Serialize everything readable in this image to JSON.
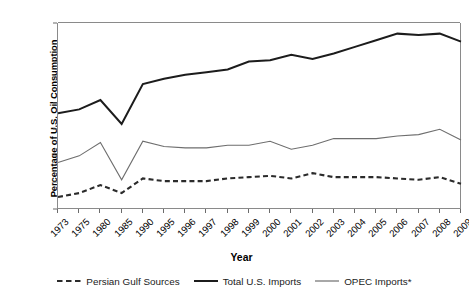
{
  "chart_data": {
    "type": "line",
    "title": "",
    "xlabel": "Year",
    "ylabel": "Percentage of U.S. Oil Consumption",
    "categories": [
      "1973",
      "1975",
      "1980",
      "1985",
      "1990",
      "1995",
      "1996",
      "1997",
      "1998",
      "1999",
      "2000",
      "2001",
      "2002",
      "2003",
      "2004",
      "2005",
      "2006",
      "2007",
      "2008",
      "2009"
    ],
    "ylim": [
      0,
      70
    ],
    "yticks": [
      0,
      10,
      20,
      30,
      40,
      50,
      60,
      70
    ],
    "ytick_labels": [
      "0",
      "10",
      "20",
      "30",
      "40",
      "50",
      "60",
      "70"
    ],
    "grid": false,
    "legend_position": "bottom",
    "series": [
      {
        "name": "Persian Gulf Sources",
        "style": "dashed",
        "color": "#2b2b2b",
        "width": 2.1,
        "values": [
          4.5,
          6.0,
          9.0,
          6.0,
          11.5,
          10.5,
          10.5,
          10.5,
          11.5,
          12.0,
          12.5,
          11.5,
          13.5,
          12.0,
          12.0,
          12.0,
          11.5,
          11.0,
          12.0,
          9.5
        ]
      },
      {
        "name": "Total U.S. Imports",
        "style": "solid",
        "color": "#1c1c1c",
        "width": 2.0,
        "values": [
          36.0,
          37.5,
          41.0,
          32.0,
          47.0,
          49.0,
          50.5,
          51.5,
          52.5,
          55.5,
          56.0,
          58.0,
          56.5,
          58.5,
          61.0,
          63.5,
          66.0,
          65.5,
          66.0,
          63.0
        ]
      },
      {
        "name": "OPEC Imports*",
        "style": "solid",
        "color": "#6e6e6e",
        "width": 1.1,
        "values": [
          17.5,
          20.0,
          25.0,
          11.0,
          25.5,
          23.5,
          23.0,
          23.0,
          24.0,
          24.0,
          25.5,
          22.5,
          24.0,
          26.5,
          26.5,
          26.5,
          27.5,
          28.0,
          30.0,
          26.0
        ]
      }
    ]
  },
  "legend": {
    "items": [
      {
        "label": "Persian Gulf Sources",
        "style": "dashed",
        "color": "#2b2b2b"
      },
      {
        "label": "Total U.S. Imports",
        "style": "solid",
        "color": "#1c1c1c"
      },
      {
        "label": "OPEC Imports*",
        "style": "solid",
        "color": "#6e6e6e"
      }
    ]
  },
  "colors": {
    "background": "#ffffff",
    "axis": "#8a8a8a",
    "text": "#000000"
  }
}
